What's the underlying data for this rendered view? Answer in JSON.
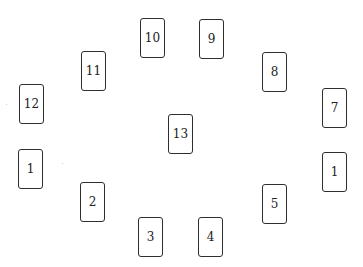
{
  "diagram": {
    "title": "",
    "layout": "circular spread of 12 cards with a 13th card in the center",
    "cards": [
      {
        "label": "10",
        "x": 140,
        "y": 18,
        "w": 25,
        "h": 40
      },
      {
        "label": "9",
        "x": 199,
        "y": 19,
        "w": 25,
        "h": 40
      },
      {
        "label": "11",
        "x": 81,
        "y": 51,
        "w": 25,
        "h": 40
      },
      {
        "label": "8",
        "x": 262,
        "y": 52,
        "w": 25,
        "h": 40
      },
      {
        "label": "12",
        "x": 19,
        "y": 84,
        "w": 25,
        "h": 40
      },
      {
        "label": "7",
        "x": 322,
        "y": 88,
        "w": 25,
        "h": 40
      },
      {
        "label": "13",
        "x": 168,
        "y": 114,
        "w": 25,
        "h": 40
      },
      {
        "label": "1",
        "x": 18,
        "y": 149,
        "w": 25,
        "h": 40
      },
      {
        "label": "1",
        "x": 322,
        "y": 152,
        "w": 25,
        "h": 40
      },
      {
        "label": "2",
        "x": 80,
        "y": 182,
        "w": 25,
        "h": 40
      },
      {
        "label": "5",
        "x": 262,
        "y": 184,
        "w": 25,
        "h": 40
      },
      {
        "label": "3",
        "x": 138,
        "y": 217,
        "w": 25,
        "h": 40
      },
      {
        "label": "4",
        "x": 198,
        "y": 217,
        "w": 25,
        "h": 40
      }
    ],
    "colors": {
      "border": "#2e2e2e",
      "text": "#222222",
      "background": "#ffffff"
    }
  }
}
